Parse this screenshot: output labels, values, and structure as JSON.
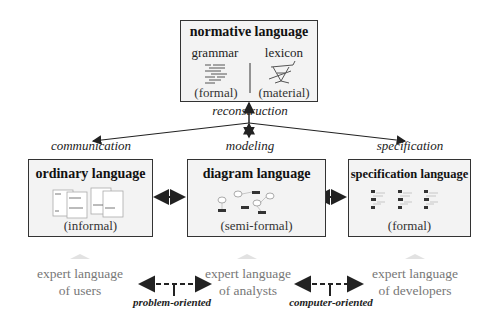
{
  "top_box": {
    "title": "normative language",
    "left_label": "grammar",
    "left_sub": "(formal)",
    "right_label": "lexicon",
    "right_sub": "(material)"
  },
  "relations": {
    "reconstruction": "reconstruction",
    "communication": "communication",
    "modeling": "modeling",
    "specification": "specification"
  },
  "boxes": [
    {
      "title": "ordinary language",
      "sub": "(informal)"
    },
    {
      "title": "diagram language",
      "sub": "(semi-formal)"
    },
    {
      "title": "specification language",
      "sub": "(formal)"
    }
  ],
  "experts": [
    {
      "line1": "expert language",
      "line2": "of users"
    },
    {
      "line1": "expert language",
      "line2": "of analysts"
    },
    {
      "line1": "expert language",
      "line2": "of developers"
    }
  ],
  "orientations": {
    "problem": "problem-oriented",
    "computer": "computer-oriented"
  },
  "colors": {
    "box_fill": "#f3f3f3",
    "border": "#333333",
    "expert_text": "#777777"
  }
}
